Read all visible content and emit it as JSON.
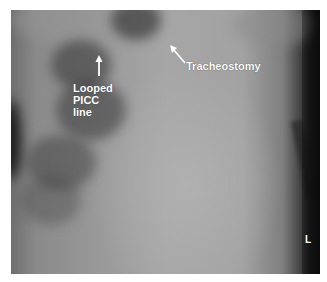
{
  "image": {
    "type": "chest radiograph",
    "background_color": "#ffffff"
  },
  "annotations": [
    {
      "id": "picc",
      "label_lines": [
        "Looped",
        "PICC",
        "line"
      ],
      "arrow_direction": "up",
      "color": "#ffffff"
    },
    {
      "id": "tracheostomy",
      "label": "Tracheostomy",
      "arrow_direction": "up-left",
      "color": "#ffffff"
    }
  ],
  "side_marker": "L"
}
